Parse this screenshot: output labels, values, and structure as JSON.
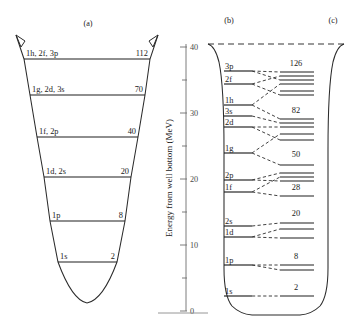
{
  "figure": {
    "background": "#ffffff",
    "ink": "#2b2b2b"
  },
  "panels": {
    "a": {
      "label": "(a)",
      "label_x": 88,
      "label_y": 26,
      "caption": "Harmonic oscillator potential"
    },
    "b": {
      "label": "(b)",
      "label_x": 229,
      "label_y": 23,
      "caption": "Woods-Saxon potential"
    },
    "c": {
      "label": "(c)",
      "label_x": 333,
      "label_y": 23,
      "caption": "Woods-Saxon plus spin-orbit"
    }
  },
  "axis": {
    "title": "Energy from well bottom (MeV)",
    "unit": "MeV",
    "title_x": 172,
    "title_y": 178,
    "x": 186,
    "y_top": 44,
    "y_bottom": 311,
    "major_ticks": [
      {
        "value": "0",
        "y": 311
      },
      {
        "value": "10",
        "y": 245
      },
      {
        "value": "20",
        "y": 179
      },
      {
        "value": "30",
        "y": 113
      },
      {
        "value": "40",
        "y": 47
      }
    ],
    "minor_ticks_y": [
      278,
      212,
      146,
      80
    ],
    "range": [
      0,
      42
    ],
    "baseline": {
      "x1": 158,
      "x2": 208,
      "y": 313
    }
  },
  "panel_a": {
    "levels": [
      {
        "orbitals": "1h, 2f, 3p",
        "count": "112",
        "y": 59,
        "x1": 24,
        "x2": 150
      },
      {
        "orbitals": "1g, 2d, 3s",
        "count": "70",
        "y": 95,
        "x1": 30,
        "x2": 145
      },
      {
        "orbitals": "1f, 2p",
        "count": "40",
        "y": 137,
        "x1": 37,
        "x2": 138
      },
      {
        "orbitals": "1d, 2s",
        "count": "20",
        "y": 177,
        "x1": 44,
        "x2": 131
      },
      {
        "orbitals": "1p",
        "count": "8",
        "y": 221,
        "x1": 50,
        "x2": 125
      },
      {
        "orbitals": "1s",
        "count": "2",
        "y": 262,
        "x1": 58,
        "x2": 117
      }
    ]
  },
  "panel_b": {
    "levels": [
      {
        "orbital": "3p",
        "y": 71,
        "x1": 224,
        "x2": 252
      },
      {
        "orbital": "2f",
        "y": 84,
        "x1": 224,
        "x2": 252
      },
      {
        "orbital": "1h",
        "y": 105,
        "x1": 224,
        "x2": 252
      },
      {
        "orbital": "3s",
        "y": 116,
        "x1": 224,
        "x2": 252
      },
      {
        "orbital": "2d",
        "y": 127,
        "x1": 224,
        "x2": 252
      },
      {
        "orbital": "1g",
        "y": 153,
        "x1": 224,
        "x2": 252
      },
      {
        "orbital": "2p",
        "y": 180,
        "x1": 224,
        "x2": 252
      },
      {
        "orbital": "1f",
        "y": 192,
        "x1": 224,
        "x2": 252
      },
      {
        "orbital": "2s",
        "y": 226,
        "x1": 224,
        "x2": 252
      },
      {
        "orbital": "1d",
        "y": 237,
        "x1": 224,
        "x2": 252
      },
      {
        "orbital": "1p",
        "y": 265,
        "x1": 224,
        "x2": 252
      },
      {
        "orbital": "1s",
        "y": 296,
        "x1": 224,
        "x2": 252
      }
    ]
  },
  "panel_c": {
    "shells": [
      {
        "magic": "126",
        "magic_x": 296,
        "magic_y": 66,
        "sublevels_y": [
          72,
          76,
          80,
          84,
          91,
          95
        ],
        "x1": 280,
        "x2": 314
      },
      {
        "magic": "82",
        "magic_x": 296,
        "magic_y": 113,
        "sublevels_y": [
          119,
          123,
          127,
          134,
          140
        ],
        "x1": 280,
        "x2": 314
      },
      {
        "magic": "50",
        "magic_x": 296,
        "magic_y": 157,
        "sublevels_y": [
          165,
          173,
          177,
          181
        ],
        "x1": 280,
        "x2": 314
      },
      {
        "magic": "28",
        "magic_x": 296,
        "magic_y": 190,
        "sublevels_y": [
          196
        ],
        "x1": 280,
        "x2": 314
      },
      {
        "magic": "20",
        "magic_x": 296,
        "magic_y": 216,
        "sublevels_y": [
          223,
          229,
          238
        ],
        "x1": 280,
        "x2": 314
      },
      {
        "magic": "8",
        "magic_x": 296,
        "magic_y": 259,
        "sublevels_y": [
          265,
          270
        ],
        "x1": 280,
        "x2": 314
      },
      {
        "magic": "2",
        "magic_x": 296,
        "magic_y": 290,
        "sublevels_y": [
          296
        ],
        "x1": 280,
        "x2": 314
      }
    ]
  },
  "splitting": {
    "description": "dashed fan connectors from panel (b) levels to panel (c) split sublevels",
    "links": [
      {
        "from_x": 252,
        "from_y": 71,
        "to_x": 280,
        "to_y": 72
      },
      {
        "from_x": 252,
        "from_y": 71,
        "to_x": 280,
        "to_y": 80
      },
      {
        "from_x": 252,
        "from_y": 84,
        "to_x": 280,
        "to_y": 76
      },
      {
        "from_x": 252,
        "from_y": 84,
        "to_x": 280,
        "to_y": 95
      },
      {
        "from_x": 252,
        "from_y": 105,
        "to_x": 280,
        "to_y": 84
      },
      {
        "from_x": 252,
        "from_y": 105,
        "to_x": 280,
        "to_y": 119
      },
      {
        "from_x": 252,
        "from_y": 116,
        "to_x": 280,
        "to_y": 123
      },
      {
        "from_x": 252,
        "from_y": 127,
        "to_x": 280,
        "to_y": 127
      },
      {
        "from_x": 252,
        "from_y": 127,
        "to_x": 280,
        "to_y": 140
      },
      {
        "from_x": 252,
        "from_y": 153,
        "to_x": 280,
        "to_y": 134
      },
      {
        "from_x": 252,
        "from_y": 153,
        "to_x": 280,
        "to_y": 165
      },
      {
        "from_x": 252,
        "from_y": 180,
        "to_x": 280,
        "to_y": 173
      },
      {
        "from_x": 252,
        "from_y": 180,
        "to_x": 280,
        "to_y": 181
      },
      {
        "from_x": 252,
        "from_y": 192,
        "to_x": 280,
        "to_y": 177
      },
      {
        "from_x": 252,
        "from_y": 192,
        "to_x": 280,
        "to_y": 196
      },
      {
        "from_x": 252,
        "from_y": 226,
        "to_x": 280,
        "to_y": 223
      },
      {
        "from_x": 252,
        "from_y": 237,
        "to_x": 280,
        "to_y": 229
      },
      {
        "from_x": 252,
        "from_y": 237,
        "to_x": 280,
        "to_y": 238
      },
      {
        "from_x": 252,
        "from_y": 265,
        "to_x": 280,
        "to_y": 265
      },
      {
        "from_x": 252,
        "from_y": 265,
        "to_x": 280,
        "to_y": 270
      },
      {
        "from_x": 252,
        "from_y": 296,
        "to_x": 280,
        "to_y": 296
      }
    ]
  }
}
